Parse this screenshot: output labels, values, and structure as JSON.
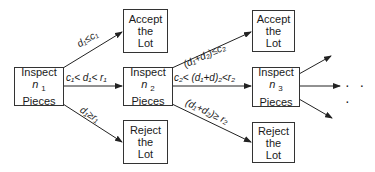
{
  "diagram": {
    "type": "sequential sampling plan flowchart",
    "nodes": {
      "inspect1": {
        "line1": "Inspect",
        "var": "n",
        "sub": "1",
        "line3": "Pieces"
      },
      "inspect2": {
        "line1": "Inspect",
        "var": "n",
        "sub": "2",
        "line3": "Pieces"
      },
      "inspect3": {
        "line1": "Inspect",
        "var": "n",
        "sub": "3",
        "line3": "Pieces"
      },
      "accept1": {
        "line1": "Accept",
        "line2": "the",
        "line3": "Lot"
      },
      "accept2": {
        "line1": "Accept",
        "line2": "the",
        "line3": "Lot"
      },
      "reject1": {
        "line1": "Reject",
        "line2": "the",
        "line3": "Lot"
      },
      "reject2": {
        "line1": "Reject",
        "line2": "the",
        "line3": "Lot"
      }
    },
    "edges": {
      "e1_accept": "d₁≤c₁",
      "e1_continue": "c₁< d₁<  r₁",
      "e1_reject": "d₁≥r₁",
      "e2_accept": "(d₁+d₂)≤c₂",
      "e2_continue": "c₂< (d₁+d)₂<r₂",
      "e2_reject": "(d₁+d₂)≥ r₂"
    },
    "continuation": "· · ·",
    "colors": {
      "line": "#222222",
      "box_border": "#333333",
      "background": "#ffffff"
    }
  }
}
